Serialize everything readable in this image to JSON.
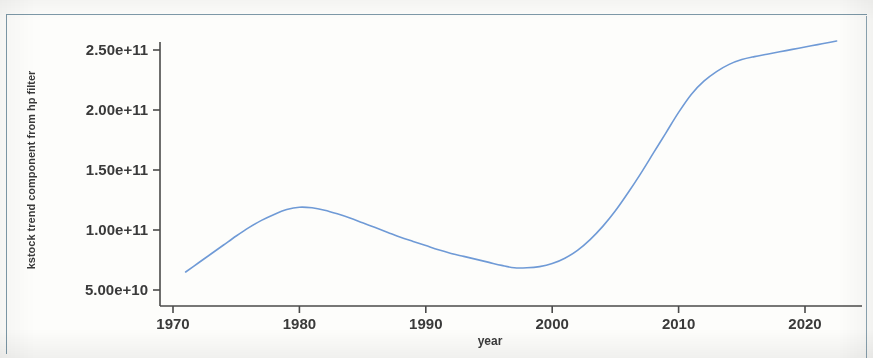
{
  "figure": {
    "frame_color": "#7d99a8",
    "background": "#fdfdfb"
  },
  "chart_data": {
    "type": "line",
    "title": "",
    "subtitle": "",
    "xlabel": "year",
    "ylabel": "kstock trend component from hp filter",
    "series": [
      {
        "name": "kstock trend component from hp filter",
        "color": "#6f9ad6",
        "x": [
          1971.0,
          1972.0,
          1973.0,
          1974.0,
          1975.0,
          1976.0,
          1977.0,
          1978.0,
          1979.0,
          1980.0,
          1981.0,
          1982.0,
          1983.0,
          1984.0,
          1985.0,
          1986.0,
          1987.0,
          1988.0,
          1989.0,
          1990.0,
          1991.0,
          1992.0,
          1993.0,
          1994.0,
          1995.0,
          1996.0,
          1997.0,
          1998.0,
          1999.0,
          2000.0,
          2001.0,
          2002.0,
          2003.0,
          2004.0,
          2005.0,
          2006.0,
          2007.0,
          2008.0,
          2009.0,
          2010.0,
          2011.0,
          2012.0,
          2013.0,
          2014.0,
          2015.0,
          2016.0,
          2017.0,
          2018.0,
          2019.0,
          2020.0,
          2021.0,
          2022.0,
          2022.5
        ],
        "y": [
          65000000000.0,
          72500000000.0,
          80000000000.0,
          87500000000.0,
          95000000000.0,
          102000000000.0,
          108000000000.0,
          113000000000.0,
          117000000000.0,
          119000000000.0,
          118500000000.0,
          116500000000.0,
          113500000000.0,
          110000000000.0,
          106000000000.0,
          102000000000.0,
          98000000000.0,
          94000000000.0,
          90500000000.0,
          87000000000.0,
          83500000000.0,
          80500000000.0,
          78000000000.0,
          75500000000.0,
          73000000000.0,
          70500000000.0,
          68500000000.0,
          68500000000.0,
          69500000000.0,
          72000000000.0,
          76500000000.0,
          83000000000.0,
          92000000000.0,
          103000000000.0,
          116000000000.0,
          131000000000.0,
          147000000000.0,
          164000000000.0,
          181000000000.0,
          198000000000.0,
          213000000000.0,
          224000000000.0,
          232000000000.0,
          238000000000.0,
          242000000000.0,
          244500000000.0,
          246500000000.0,
          248500000000.0,
          250500000000.0,
          252500000000.0,
          254500000000.0,
          256500000000.0,
          257500000000.0
        ]
      }
    ],
    "xticks": [
      1970,
      1980,
      1990,
      2000,
      2010,
      2020
    ],
    "xtick_labels": [
      "1970",
      "1980",
      "1990",
      "2000",
      "2010",
      "2020"
    ],
    "yticks": [
      50000000000.0,
      100000000000.0,
      150000000000.0,
      200000000000.0,
      250000000000.0
    ],
    "ytick_labels": [
      "5.00e+10",
      "1.00e+11",
      "1.50e+11",
      "2.00e+11",
      "2.50e+11"
    ],
    "xlim": [
      1969.2,
      2023.5
    ],
    "ylim": [
      42000000000.0,
      262000000000.0
    ],
    "grid": false,
    "legend": null,
    "legend_position": "none",
    "line_width": 1.6,
    "annotations": []
  }
}
